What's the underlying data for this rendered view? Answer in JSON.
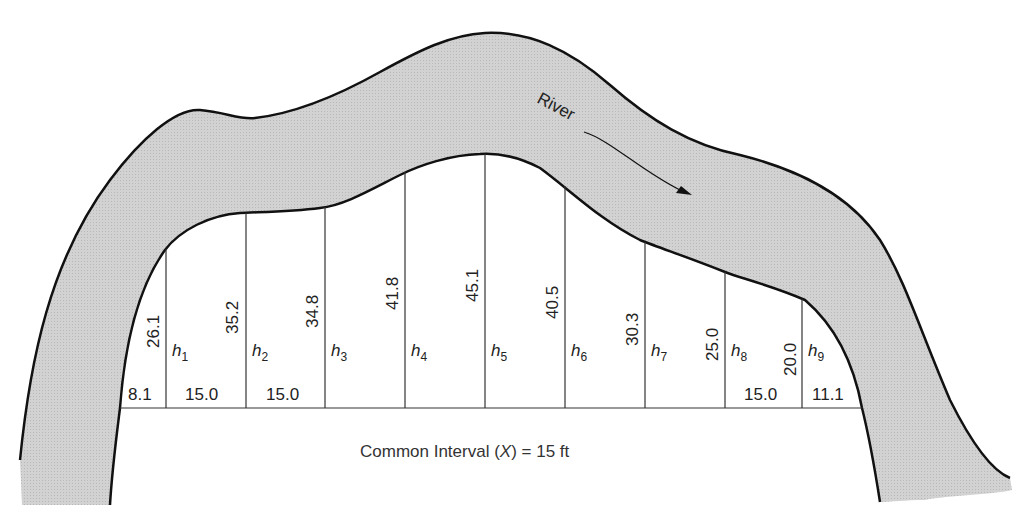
{
  "diagram": {
    "type": "offset-measurement-figure",
    "river": {
      "label": "River",
      "fill_color": "#cfcfcf",
      "bank_color": "#111111",
      "flow_direction": "arrow pointing downstream to the right"
    },
    "baseline": {
      "caption_prefix": "Common Interval (",
      "caption_var": "X",
      "caption_suffix": ") = 15 ft",
      "common_interval": "15 ft"
    },
    "offsets": [
      {
        "label": "h",
        "sub": "1",
        "value": "26.1"
      },
      {
        "label": "h",
        "sub": "2",
        "value": "35.2"
      },
      {
        "label": "h",
        "sub": "3",
        "value": "34.8"
      },
      {
        "label": "h",
        "sub": "4",
        "value": "41.8"
      },
      {
        "label": "h",
        "sub": "5",
        "value": "45.1"
      },
      {
        "label": "h",
        "sub": "6",
        "value": "40.5"
      },
      {
        "label": "h",
        "sub": "7",
        "value": "30.3"
      },
      {
        "label": "h",
        "sub": "8",
        "value": "25.0"
      },
      {
        "label": "h",
        "sub": "9",
        "value": "20.0"
      }
    ],
    "intervals": {
      "first": "8.1",
      "second": "15.0",
      "third": "15.0",
      "second_last": "15.0",
      "last": "11.1"
    }
  }
}
